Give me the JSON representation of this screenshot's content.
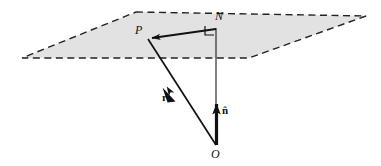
{
  "figure": {
    "background_color": "#ffffff",
    "line_color": "#111111",
    "plane_fill_color": "#e2e2e2",
    "plane_stroke_color": "#222222",
    "labels": {
      "point_P": "P",
      "point_N": "N",
      "point_O": "O",
      "vector_r": "r",
      "vector_n_hat": "n̂"
    },
    "elements": {
      "plane": "dashed-parallelogram-shaded",
      "right_angle_marker": "right-angle-square-at-N",
      "segment_NP": "arrow-from-N-to-P",
      "segment_ON": "thin-line-from-O-to-N",
      "segment_OP": "arrow-from-O-to-P-labelled-r",
      "normal_arrow": "thick-arrow-from-O-upward-labelled-n-hat"
    },
    "geometry": {
      "plane_corners": [
        [
          136,
          12
        ],
        [
          366,
          16
        ],
        [
          249,
          58
        ],
        [
          22,
          58
        ]
      ],
      "point_P": [
        148,
        38
      ],
      "point_N": [
        216,
        28
      ],
      "point_O": [
        216,
        145
      ],
      "r_arrow_tip": [
        160,
        92
      ],
      "n_hat_arrow_tip": [
        216,
        99
      ]
    }
  }
}
